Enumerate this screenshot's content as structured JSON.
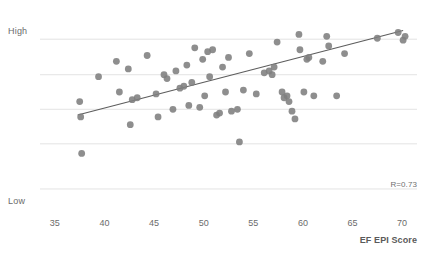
{
  "chart_data": {
    "type": "scatter",
    "title": "",
    "xlabel": "EF EPI Score",
    "ylabel": "",
    "xlim": [
      33.5,
      71.5
    ],
    "ylim": [
      0,
      10
    ],
    "xticks": [
      35,
      40,
      45,
      50,
      55,
      60,
      65,
      70
    ],
    "ytick_labels": [
      "Low",
      "High"
    ],
    "ygridlines": [
      1.2,
      3.55,
      5.35,
      7.15,
      9.0
    ],
    "grid": true,
    "legend": false,
    "annotation": "R=0.73",
    "correlation": 0.73,
    "trendline": {
      "x_start": 37.3,
      "y_start": 5.05,
      "x_end": 70.1,
      "y_end": 9.45,
      "color": "#5d5d5d"
    },
    "point_color": "#7e7e7e",
    "point_radius": 3.4,
    "points": [
      {
        "x": 37.5,
        "y": 5.75
      },
      {
        "x": 37.6,
        "y": 4.95
      },
      {
        "x": 37.7,
        "y": 3.05
      },
      {
        "x": 39.4,
        "y": 7.05
      },
      {
        "x": 41.2,
        "y": 7.85
      },
      {
        "x": 41.5,
        "y": 6.25
      },
      {
        "x": 42.4,
        "y": 7.45
      },
      {
        "x": 42.6,
        "y": 4.55
      },
      {
        "x": 42.8,
        "y": 5.85
      },
      {
        "x": 43.3,
        "y": 5.95
      },
      {
        "x": 44.3,
        "y": 8.15
      },
      {
        "x": 45.2,
        "y": 6.15
      },
      {
        "x": 45.4,
        "y": 4.95
      },
      {
        "x": 46.0,
        "y": 7.15
      },
      {
        "x": 46.3,
        "y": 6.95
      },
      {
        "x": 46.9,
        "y": 5.35
      },
      {
        "x": 47.2,
        "y": 7.35
      },
      {
        "x": 47.6,
        "y": 6.45
      },
      {
        "x": 48.0,
        "y": 6.55
      },
      {
        "x": 48.3,
        "y": 7.65
      },
      {
        "x": 48.5,
        "y": 5.55
      },
      {
        "x": 48.8,
        "y": 6.75
      },
      {
        "x": 49.1,
        "y": 8.55
      },
      {
        "x": 49.6,
        "y": 5.45
      },
      {
        "x": 49.9,
        "y": 7.95
      },
      {
        "x": 50.1,
        "y": 6.05
      },
      {
        "x": 50.4,
        "y": 8.35
      },
      {
        "x": 50.6,
        "y": 7.05
      },
      {
        "x": 50.9,
        "y": 8.45
      },
      {
        "x": 51.3,
        "y": 5.05
      },
      {
        "x": 51.6,
        "y": 5.15
      },
      {
        "x": 51.9,
        "y": 7.55
      },
      {
        "x": 52.2,
        "y": 6.25
      },
      {
        "x": 52.5,
        "y": 8.05
      },
      {
        "x": 52.8,
        "y": 5.25
      },
      {
        "x": 53.4,
        "y": 5.35
      },
      {
        "x": 53.6,
        "y": 3.65
      },
      {
        "x": 54.0,
        "y": 6.35
      },
      {
        "x": 54.6,
        "y": 8.25
      },
      {
        "x": 55.3,
        "y": 6.15
      },
      {
        "x": 56.1,
        "y": 7.25
      },
      {
        "x": 56.6,
        "y": 7.35
      },
      {
        "x": 56.9,
        "y": 7.15
      },
      {
        "x": 57.1,
        "y": 7.55
      },
      {
        "x": 57.4,
        "y": 8.85
      },
      {
        "x": 57.9,
        "y": 6.25
      },
      {
        "x": 58.1,
        "y": 5.95
      },
      {
        "x": 58.4,
        "y": 6.05
      },
      {
        "x": 58.6,
        "y": 5.75
      },
      {
        "x": 58.9,
        "y": 5.25
      },
      {
        "x": 59.2,
        "y": 4.85
      },
      {
        "x": 59.6,
        "y": 9.25
      },
      {
        "x": 59.7,
        "y": 8.45
      },
      {
        "x": 60.1,
        "y": 6.25
      },
      {
        "x": 60.4,
        "y": 7.95
      },
      {
        "x": 60.6,
        "y": 8.05
      },
      {
        "x": 61.1,
        "y": 6.05
      },
      {
        "x": 62.0,
        "y": 7.85
      },
      {
        "x": 62.4,
        "y": 9.15
      },
      {
        "x": 62.6,
        "y": 8.65
      },
      {
        "x": 63.4,
        "y": 6.05
      },
      {
        "x": 64.2,
        "y": 8.25
      },
      {
        "x": 67.5,
        "y": 9.05
      },
      {
        "x": 69.6,
        "y": 9.35
      },
      {
        "x": 70.1,
        "y": 8.95
      },
      {
        "x": 70.3,
        "y": 9.15
      }
    ]
  },
  "axes": {
    "y_high_label": "High",
    "y_low_label": "Low",
    "x_title": "EF EPI Score"
  },
  "annotations": {
    "r_value": "R=0.73"
  },
  "cut_off_header": {
    "text": ""
  }
}
